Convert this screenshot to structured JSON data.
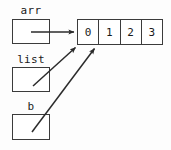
{
  "diagram": {
    "type": "pointer-diagram",
    "background_color": "#fdfdfd",
    "stroke_color": "#3b3b3b",
    "text_color": "#1a1a1a",
    "variables": [
      {
        "id": "arr",
        "label": "arr",
        "label_x": 31,
        "label_y": 5,
        "box_x": 12,
        "box_y": 19,
        "box_w": 38,
        "box_h": 25
      },
      {
        "id": "list",
        "label": "list",
        "label_x": 31,
        "label_y": 54,
        "box_x": 12,
        "box_y": 67,
        "box_w": 38,
        "box_h": 25
      },
      {
        "id": "b",
        "label": "b",
        "label_x": 31,
        "label_y": 101,
        "box_x": 12,
        "box_y": 114,
        "box_w": 38,
        "box_h": 26
      }
    ],
    "array": {
      "x": 77,
      "y": 19,
      "width": 86,
      "height": 26,
      "cells": [
        "0",
        "1",
        "2",
        "3"
      ]
    },
    "arrows": [
      {
        "id": "arr-to-array",
        "from_x": 31,
        "from_y": 32,
        "to_x": 76,
        "to_y": 32,
        "style": "straight"
      },
      {
        "id": "list-to-array",
        "from_x": 33,
        "from_y": 86,
        "to_x": 77,
        "to_y": 46,
        "style": "diagonal"
      },
      {
        "id": "b-to-array",
        "from_x": 32,
        "from_y": 132,
        "to_x": 96,
        "to_y": 47,
        "style": "diagonal"
      }
    ]
  }
}
